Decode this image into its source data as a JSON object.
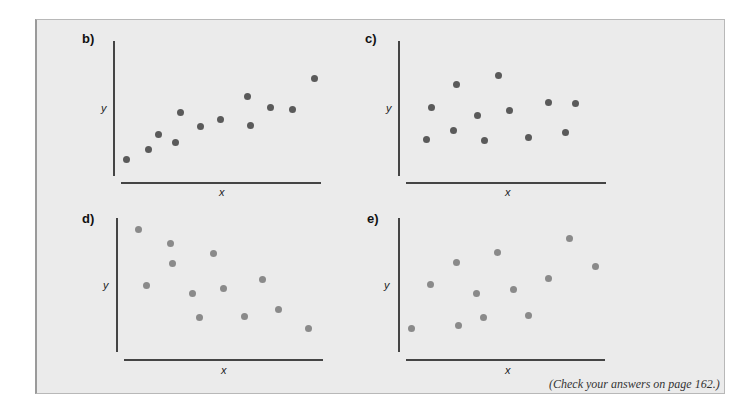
{
  "note": "(Check your answers on page 162.)",
  "chart_data": [
    {
      "type": "scatter",
      "title": "b)",
      "xlabel": "x",
      "ylabel": "y",
      "grid": false,
      "points": [
        [
          126,
          159
        ],
        [
          148,
          149
        ],
        [
          158,
          134
        ],
        [
          175,
          142
        ],
        [
          180,
          112
        ],
        [
          200,
          126
        ],
        [
          220,
          119
        ],
        [
          247,
          96
        ],
        [
          250,
          125
        ],
        [
          270,
          107
        ],
        [
          292,
          109
        ],
        [
          314,
          78
        ]
      ],
      "trend": "positive"
    },
    {
      "type": "scatter",
      "title": "c)",
      "xlabel": "x",
      "ylabel": "y",
      "grid": false,
      "points": [
        [
          426,
          139
        ],
        [
          431,
          107
        ],
        [
          453,
          130
        ],
        [
          456,
          84
        ],
        [
          477,
          115
        ],
        [
          484,
          140
        ],
        [
          498,
          75
        ],
        [
          509,
          110
        ],
        [
          528,
          137
        ],
        [
          548,
          102
        ],
        [
          565,
          132
        ],
        [
          575,
          103
        ]
      ],
      "trend": "none"
    },
    {
      "type": "scatter",
      "title": "d)",
      "xlabel": "x",
      "ylabel": "y",
      "grid": false,
      "points": [
        [
          138,
          229
        ],
        [
          170,
          243
        ],
        [
          172,
          263
        ],
        [
          146,
          285
        ],
        [
          192,
          293
        ],
        [
          199,
          317
        ],
        [
          213,
          253
        ],
        [
          223,
          288
        ],
        [
          244,
          316
        ],
        [
          262,
          279
        ],
        [
          278,
          309
        ],
        [
          308,
          328
        ]
      ],
      "trend": "negative"
    },
    {
      "type": "scatter",
      "title": "e)",
      "xlabel": "x",
      "ylabel": "y",
      "grid": false,
      "points": [
        [
          411,
          328
        ],
        [
          430,
          284
        ],
        [
          456,
          262
        ],
        [
          458,
          325
        ],
        [
          476,
          293
        ],
        [
          483,
          317
        ],
        [
          497,
          252
        ],
        [
          513,
          289
        ],
        [
          528,
          315
        ],
        [
          548,
          278
        ],
        [
          569,
          238
        ],
        [
          595,
          266
        ]
      ],
      "trend": "positive"
    }
  ]
}
